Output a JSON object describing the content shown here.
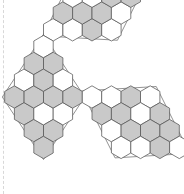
{
  "figure": {
    "title": "Hexagonal tiling of a hexagon by three rhombi",
    "type": "geometric-diagram",
    "canvas": {
      "width": 184,
      "height": 194,
      "background": "#ffffff"
    },
    "colors": {
      "shaded_fill": "#c9c9c9",
      "empty_fill": "#ffffff",
      "cell_stroke": "#555555",
      "rhombus_stroke": "#777777",
      "margin_rule": "#d8d8d8"
    },
    "geometry": {
      "hex_radius": 11.2,
      "hex_orientation": "flat-top",
      "center_x": 92,
      "center_y": 97,
      "rhombus_count": 3,
      "cells_per_rhombus": 16,
      "rhombus_rows": 4,
      "rhombus_cols": 4
    },
    "margin_rule": {
      "x": 3,
      "visible": true,
      "style": "dashed"
    },
    "rhombi": [
      {
        "name": "top-rhombus",
        "origin_q": 0,
        "origin_r": -4,
        "axis_a": [
          1,
          0
        ],
        "axis_b": [
          1,
          -1
        ],
        "shaded": [
          [
            0,
            0
          ],
          [
            0,
            1
          ],
          [
            0,
            2
          ],
          [
            0,
            3
          ],
          [
            1,
            0
          ],
          [
            1,
            1
          ],
          [
            1,
            2
          ],
          [
            1,
            3
          ],
          [
            2,
            0
          ],
          [
            2,
            1
          ],
          [
            2,
            2
          ],
          [
            2,
            3
          ],
          [
            3,
            0
          ],
          [
            3,
            1
          ],
          [
            3,
            2
          ],
          [
            3,
            3
          ]
        ],
        "pattern": [
          [
            0,
            0,
            1,
            0
          ],
          [
            1,
            1,
            1,
            0
          ],
          [
            0,
            0,
            1,
            1
          ],
          [
            0,
            0,
            0,
            1
          ]
        ]
      },
      {
        "name": "left-rhombus",
        "origin_q": -4,
        "origin_r": 0,
        "axis_a": [
          1,
          -1
        ],
        "axis_b": [
          0,
          1
        ],
        "pattern": [
          [
            1,
            0,
            1,
            0
          ],
          [
            1,
            1,
            1,
            1
          ],
          [
            1,
            0,
            1,
            0
          ],
          [
            1,
            1,
            0,
            1
          ]
        ]
      },
      {
        "name": "right-rhombus",
        "origin_q": 0,
        "origin_r": 0,
        "axis_a": [
          1,
          0
        ],
        "axis_b": [
          0,
          1
        ],
        "pattern": [
          [
            0,
            0,
            1,
            0
          ],
          [
            1,
            1,
            0,
            1
          ],
          [
            0,
            1,
            1,
            1
          ],
          [
            0,
            0,
            1,
            0
          ]
        ]
      }
    ],
    "cells": [
      {
        "cx": 68.0,
        "cy": 26.0,
        "fill": "empty"
      },
      {
        "cx": 87.4,
        "cy": 26.0,
        "fill": "empty"
      },
      {
        "cx": 106.8,
        "cy": 26.0,
        "fill": "shaded"
      },
      {
        "cx": 126.2,
        "cy": 26.0,
        "fill": "empty"
      },
      {
        "cx": 58.3,
        "cy": 43.0,
        "fill": "shaded"
      },
      {
        "cx": 77.7,
        "cy": 43.0,
        "fill": "shaded"
      },
      {
        "cx": 97.1,
        "cy": 43.0,
        "fill": "shaded"
      },
      {
        "cx": 116.5,
        "cy": 43.0,
        "fill": "empty"
      },
      {
        "cx": 48.6,
        "cy": 60.0,
        "fill": "empty"
      },
      {
        "cx": 68.0,
        "cy": 60.0,
        "fill": "empty"
      },
      {
        "cx": 87.4,
        "cy": 60.0,
        "fill": "shaded"
      },
      {
        "cx": 106.8,
        "cy": 60.0,
        "fill": "shaded"
      },
      {
        "cx": 38.9,
        "cy": 77.0,
        "fill": "empty"
      },
      {
        "cx": 58.3,
        "cy": 77.0,
        "fill": "empty"
      },
      {
        "cx": 77.7,
        "cy": 77.0,
        "fill": "empty"
      },
      {
        "cx": 97.1,
        "cy": 77.0,
        "fill": "shaded"
      }
    ],
    "legend": [],
    "annotations": []
  }
}
